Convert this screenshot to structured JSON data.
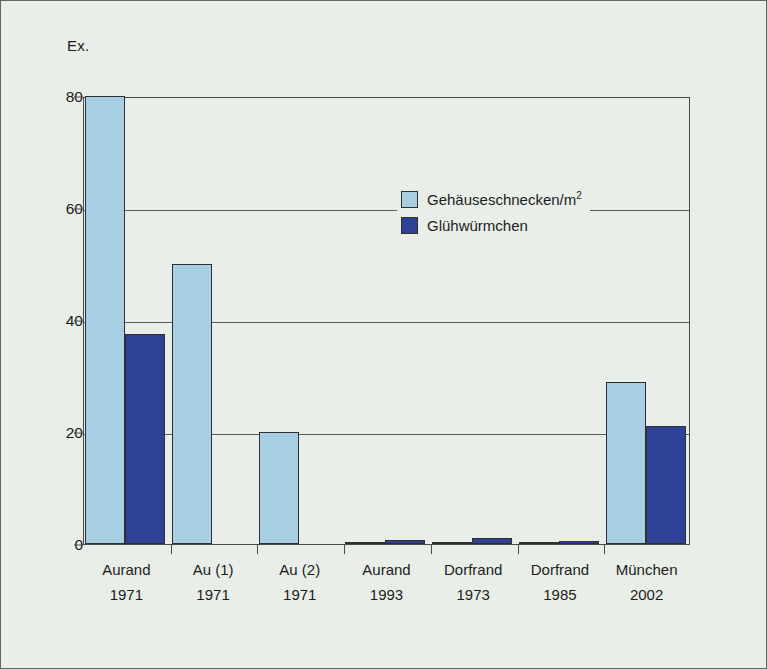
{
  "chart_data": {
    "type": "bar",
    "title": "",
    "xlabel": "",
    "ylabel": "Ex.",
    "ylim": [
      0,
      80
    ],
    "yticks": [
      0,
      20,
      40,
      60,
      80
    ],
    "grid": true,
    "legend_position": "inside-upper-right",
    "categories": [
      "Aurand 1971",
      "Au (1) 1971",
      "Au (2) 1971",
      "Aurand 1993",
      "Dorfrand 1973",
      "Dorfrand 1985",
      "München 2002"
    ],
    "category_lines": [
      {
        "place": "Aurand",
        "year": "1971"
      },
      {
        "place": "Au (1)",
        "year": "1971"
      },
      {
        "place": "Au (2)",
        "year": "1971"
      },
      {
        "place": "Aurand",
        "year": "1993"
      },
      {
        "place": "Dorfrand",
        "year": "1973"
      },
      {
        "place": "Dorfrand",
        "year": "1985"
      },
      {
        "place": "München",
        "year": "2002"
      }
    ],
    "series": [
      {
        "name": "Gehäuseschnecken/m²",
        "color": "#a6cfe3",
        "values": [
          80,
          50,
          20,
          0.3,
          0.4,
          0.2,
          29
        ],
        "clipped": [
          true,
          false,
          false,
          false,
          false,
          false,
          false
        ]
      },
      {
        "name": "Glühwürmchen",
        "color": "#2e4196",
        "values": [
          37.5,
          0,
          0,
          0.8,
          1.0,
          0.6,
          21
        ]
      }
    ]
  },
  "axis": {
    "unit_caption": "Ex.",
    "ytick_labels": [
      "0",
      "20",
      "40",
      "60",
      "80"
    ]
  },
  "legend": {
    "items": [
      {
        "label_main": "Gehäuseschnecken/m",
        "label_sup": "2",
        "swatch": "light"
      },
      {
        "label_main": "Glühwürmchen",
        "label_sup": "",
        "swatch": "dark"
      }
    ]
  },
  "colors": {
    "light_blue": "#a6cfe3",
    "dark_blue": "#2e4196",
    "background": "#e9efe8",
    "axis": "#4a4a4a",
    "bar_outline": "#2f2f2f"
  }
}
